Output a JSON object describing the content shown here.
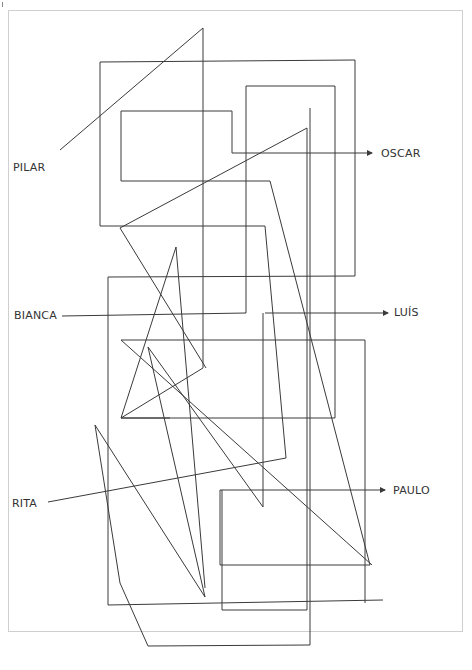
{
  "diagram": {
    "line_color": "#3a3a3a",
    "frame_color": "#cfcfcf",
    "start_labels": [
      {
        "name": "PILAR",
        "x": 24,
        "y": 168
      },
      {
        "name": "BIANCA",
        "x": 14,
        "y": 316
      },
      {
        "name": "RITA",
        "x": 12,
        "y": 504
      }
    ],
    "end_labels": [
      {
        "name": "OSCAR",
        "x": 382,
        "y": 153
      },
      {
        "name": "LUÍS",
        "x": 395,
        "y": 312
      },
      {
        "name": "PAULO",
        "x": 393,
        "y": 491
      }
    ],
    "paths": [
      {
        "id": "pilar",
        "points": "45,166 60,150 120,75 203,28 203,368 121,340 176,247 205,580 155,648 310,645 310,112 121,112 121,182 270,182 370,565 220,565 220,490 383,490"
      },
      {
        "id": "bianca",
        "points": "62,316 248,316 248,251 110,251 110,605 383,602 383,340 121,340 263,110"
      },
      {
        "id": "rita",
        "points": "45,504 286,457 265,226 120,228 266,123 266,422 139,418 148,347 290,515 292,380 335,380 335,86 245,86 245,313 378,313"
      }
    ],
    "arrows": [
      {
        "target": "OSCAR",
        "from": "232,153",
        "to": "372,153"
      },
      {
        "target": "LUÍS",
        "from": "263,313",
        "to": "388,313"
      },
      {
        "target": "PAULO",
        "from": "220,490",
        "to": "385,490"
      }
    ]
  }
}
